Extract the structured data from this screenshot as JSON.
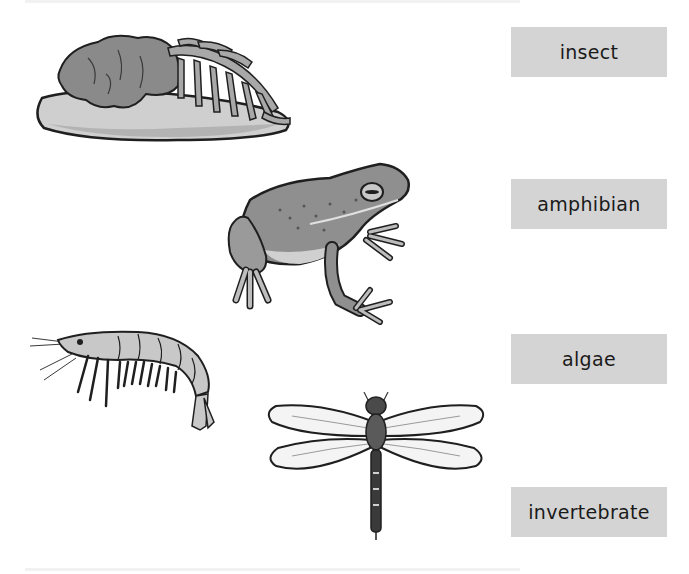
{
  "labels": [
    {
      "id": "insect",
      "text": "insect"
    },
    {
      "id": "amphibian",
      "text": "amphibian"
    },
    {
      "id": "algae",
      "text": "algae"
    },
    {
      "id": "invertebrate",
      "text": "invertebrate"
    }
  ],
  "images": [
    {
      "id": "algae-on-rock",
      "description": "algae on rock"
    },
    {
      "id": "frog",
      "description": "frog"
    },
    {
      "id": "shrimp",
      "description": "shrimp"
    },
    {
      "id": "dragonfly",
      "description": "dragonfly"
    }
  ],
  "colors": {
    "label_bg": "#d4d4d4",
    "label_text": "#1a1a1a",
    "outline": "#1f1f1f"
  }
}
